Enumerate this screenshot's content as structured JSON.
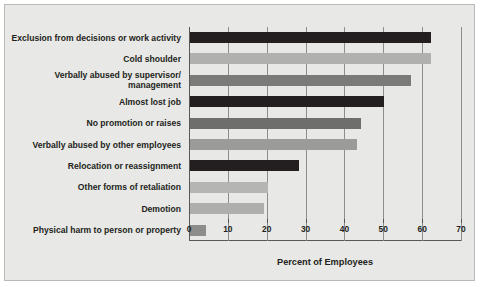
{
  "chart_data": {
    "type": "bar",
    "orientation": "horizontal",
    "title": "",
    "xlabel": "Percent of Employees",
    "ylabel": "",
    "xlim": [
      0,
      70
    ],
    "xticks": [
      0,
      10,
      20,
      30,
      40,
      50,
      60,
      70
    ],
    "grid": true,
    "grid_axis": "x",
    "legend": false,
    "categories": [
      "Exclusion from decisions or work activity",
      "Cold shoulder",
      "Verbally abused by supervisor/\nmanagement",
      "Almost lost job",
      "No promotion or raises",
      "Verbally abused by other employees",
      "Relocation or reassignment",
      "Other forms of retaliation",
      "Demotion",
      "Physical harm to person or property"
    ],
    "values": [
      62,
      62,
      57,
      50,
      44,
      43,
      28,
      20,
      19,
      4
    ],
    "bar_colors": [
      "#231f20",
      "#b0b0ae",
      "#7a7a78",
      "#231f20",
      "#6e6e6c",
      "#9b9b99",
      "#231f20",
      "#b5b5b3",
      "#aeaeac",
      "#8d8d8b"
    ],
    "background_color": "#e8e8e6",
    "frame_color": "#b9b9b7",
    "axis_color": "#58585a",
    "gridline_color": "#8e8e8c",
    "text_color": "#231f20"
  }
}
